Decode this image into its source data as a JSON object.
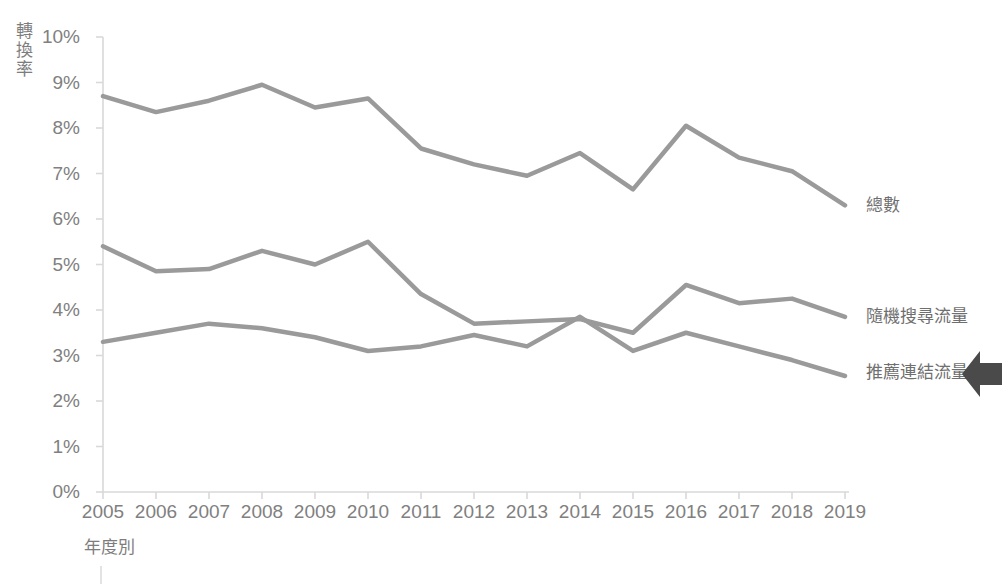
{
  "chart_data": {
    "type": "line",
    "title": "",
    "xlabel": "年度別",
    "ylabel": "轉換率",
    "x": [
      2005,
      2006,
      2007,
      2008,
      2009,
      2010,
      2011,
      2012,
      2013,
      2014,
      2015,
      2016,
      2017,
      2018,
      2019
    ],
    "categories": [
      "2005",
      "2006",
      "2007",
      "2008",
      "2009",
      "2010",
      "2011",
      "2012",
      "2013",
      "2014",
      "2015",
      "2016",
      "2017",
      "2018",
      "2019"
    ],
    "xlim": [
      2005,
      2019
    ],
    "ylim": [
      0,
      10
    ],
    "y_ticks": [
      0,
      1,
      2,
      3,
      4,
      5,
      6,
      7,
      8,
      9,
      10
    ],
    "y_tick_labels": [
      "0%",
      "1%",
      "2%",
      "3%",
      "4%",
      "5%",
      "6%",
      "7%",
      "8%",
      "9%",
      "10%"
    ],
    "y_unit": "%",
    "grid": false,
    "legend_position": "right-inline-end-labels",
    "series": [
      {
        "name": "總數",
        "color": "#9a9a9a",
        "values": [
          8.7,
          8.35,
          8.6,
          8.95,
          8.45,
          8.65,
          7.55,
          7.2,
          6.95,
          7.45,
          6.65,
          8.05,
          7.35,
          7.05,
          6.3
        ]
      },
      {
        "name": "隨機搜尋流量",
        "color": "#9a9a9a",
        "values": [
          5.4,
          4.85,
          4.9,
          5.3,
          5.0,
          5.5,
          4.35,
          3.7,
          3.75,
          3.8,
          3.5,
          4.55,
          4.15,
          4.25,
          3.85
        ]
      },
      {
        "name": "推薦連結流量",
        "color": "#9a9a9a",
        "values": [
          3.3,
          3.5,
          3.7,
          3.6,
          3.4,
          3.1,
          3.2,
          3.45,
          3.2,
          3.85,
          3.1,
          3.5,
          3.2,
          2.9,
          2.55
        ]
      }
    ]
  },
  "axis": {
    "line_color": "#d9d9d9",
    "tick_color": "#d9d9d9",
    "text_color": "#808080"
  },
  "annotation": {
    "arrow_name": "left-pointing-arrow",
    "arrow_color": "#4a4a4a",
    "arrow_target_series": "推薦連結流量"
  }
}
